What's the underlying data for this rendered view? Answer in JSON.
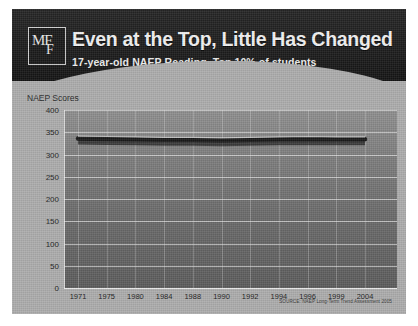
{
  "slide": {
    "logo": {
      "top_text": "MF",
      "bottom_text": "F",
      "name": "mff-logo"
    },
    "title": "Even at the Top, Little Has Changed",
    "subtitle": "17-year-old NAEP Reading, Top 10% of students",
    "source": "SOURCE: NAEP Long-Term Trend Assessment 2005",
    "colors": {
      "header_bg": "#1d1d1d",
      "slide_bg": "#adadad",
      "plot_bg": "#6f6f6f",
      "line": "#1a1a1a",
      "gridline": "#f0f0f0",
      "title_text": "#f2f2f2"
    }
  },
  "chart_data": {
    "type": "line",
    "title": "Even at the Top, Little Has Changed",
    "subtitle": "17-year-old NAEP Reading, Top 10% of students",
    "xlabel": "",
    "ylabel": "NAEP Scores",
    "categories": [
      "1971",
      "1975",
      "1980",
      "1984",
      "1988",
      "1990",
      "1992",
      "1994",
      "1996",
      "1999",
      "2004"
    ],
    "series": [
      {
        "name": "Top 10% of students",
        "values": [
          336,
          335,
          334,
          333,
          333,
          332,
          333,
          334,
          335,
          334,
          334
        ]
      }
    ],
    "ylim": [
      0,
      400
    ],
    "yticks": [
      0,
      50,
      100,
      150,
      200,
      250,
      300,
      350,
      400
    ],
    "grid": true,
    "legend": false,
    "legend_position": "none"
  }
}
